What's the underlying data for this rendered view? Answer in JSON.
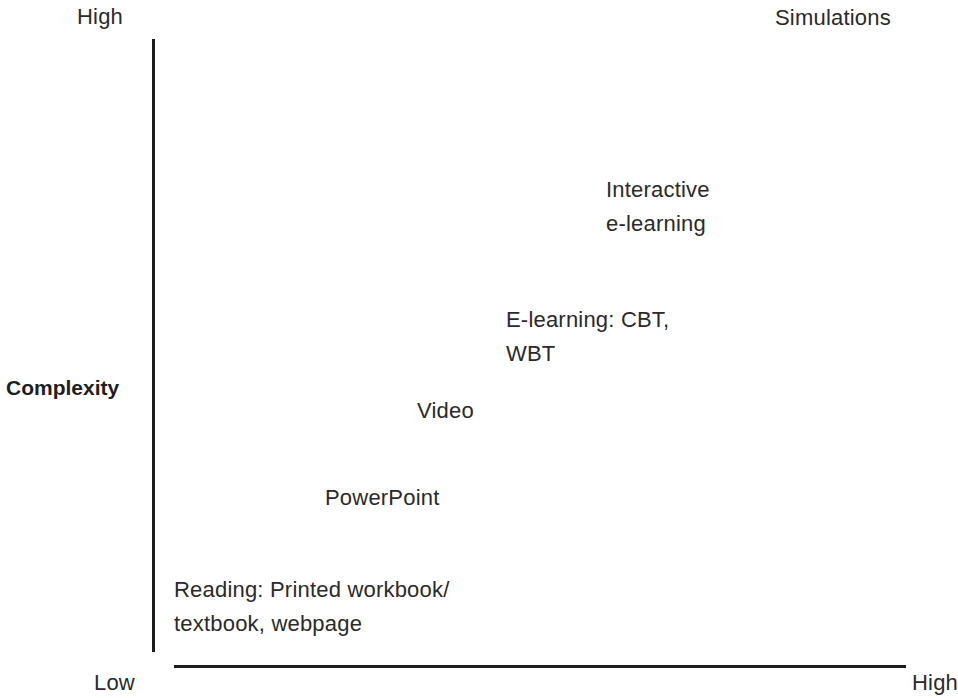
{
  "diagram": {
    "y_axis": {
      "title": "Complexity",
      "high_label": "High",
      "low_label": "Low"
    },
    "x_axis": {
      "high_label": "High"
    },
    "items": [
      {
        "id": "simulations",
        "lines": [
          "Simulations"
        ]
      },
      {
        "id": "interactive-elearning",
        "lines": [
          "Interactive",
          "e-learning"
        ]
      },
      {
        "id": "elearning-cbt-wbt",
        "lines": [
          "E-learning: CBT,",
          "WBT"
        ]
      },
      {
        "id": "video",
        "lines": [
          "Video"
        ]
      },
      {
        "id": "powerpoint",
        "lines": [
          "PowerPoint"
        ]
      },
      {
        "id": "reading",
        "lines": [
          "Reading: Printed workbook/",
          "textbook, webpage"
        ]
      }
    ],
    "colors": {
      "text": "#2a2a2a",
      "axis": "#1c1c1c",
      "background": "#ffffff"
    }
  }
}
